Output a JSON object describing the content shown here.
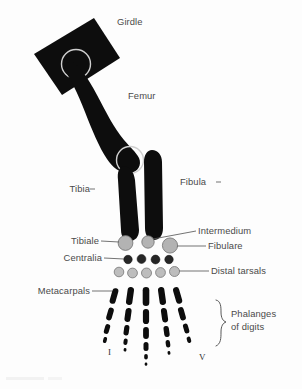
{
  "figure": {
    "background_color": "#fdfdfd",
    "bone_color": "#0d0d0d",
    "tarsal_light_color": "#b3b3b3",
    "tarsal_dark_color": "#262626",
    "joint_ring_color": "#cfcfcf",
    "label_color": "#4a4a4a"
  },
  "labels": {
    "girdle": "Girdle",
    "femur": "Femur",
    "tibia": "Tibia",
    "fibula": "Fibula",
    "tibiale": "Tibiale",
    "intermedium": "Intermedium",
    "centralia": "Centralia",
    "fibulare": "Fibulare",
    "distal_tarsals": "Distal tarsals",
    "metacarpals": "Metacarpals",
    "phalanges_line1": "Phalanges",
    "phalanges_line2": "of digits",
    "digit_first": "I",
    "digit_fifth": "V"
  },
  "anatomy": {
    "girdle": {
      "shape": "rotated-rectangle",
      "acetabulum": "light circle socket"
    },
    "proximal_tarsals": [
      {
        "name": "tibiale",
        "cx": 125.5,
        "cy": 243.0,
        "r": 7.4,
        "shade": "light"
      },
      {
        "name": "intermedium",
        "cx": 148.0,
        "cy": 242.0,
        "r": 6.2,
        "shade": "light"
      },
      {
        "name": "fibulare",
        "cx": 170.0,
        "cy": 245.5,
        "r": 7.6,
        "shade": "light"
      }
    ],
    "centralia": [
      {
        "cx": 128.0,
        "cy": 259.5,
        "r": 4.2
      },
      {
        "cx": 141.5,
        "cy": 259.0,
        "r": 4.4
      },
      {
        "cx": 155.5,
        "cy": 259.5,
        "r": 4.4
      },
      {
        "cx": 169.0,
        "cy": 259.5,
        "r": 4.2
      }
    ],
    "distal_tarsals": [
      {
        "cx": 119.0,
        "cy": 272.0,
        "r": 4.8
      },
      {
        "cx": 132.5,
        "cy": 273.0,
        "r": 4.9
      },
      {
        "cx": 146.5,
        "cy": 273.0,
        "r": 5.0
      },
      {
        "cx": 160.5,
        "cy": 272.5,
        "r": 4.9
      },
      {
        "cx": 174.5,
        "cy": 271.5,
        "r": 5.0
      }
    ],
    "digits": [
      {
        "numeral": "I",
        "elements": [
          {
            "x": 114.0,
            "y": 288.0,
            "w": 6.0,
            "h": 16.0,
            "rot": 16
          },
          {
            "x": 110.0,
            "y": 307.5,
            "w": 5.6,
            "h": 13.0,
            "rot": 16
          },
          {
            "x": 107.0,
            "y": 324.0,
            "w": 5.0,
            "h": 10.0,
            "rot": 16
          },
          {
            "x": 105.0,
            "y": 337.0,
            "w": 3.6,
            "h": 6.0,
            "rot": 16
          }
        ]
      },
      {
        "numeral": "II",
        "elements": [
          {
            "x": 130.0,
            "y": 287.0,
            "w": 6.4,
            "h": 18.0,
            "rot": 8
          },
          {
            "x": 128.0,
            "y": 308.0,
            "w": 6.0,
            "h": 14.0,
            "rot": 8
          },
          {
            "x": 126.5,
            "y": 325.0,
            "w": 5.2,
            "h": 10.5,
            "rot": 8
          },
          {
            "x": 125.5,
            "y": 338.5,
            "w": 4.0,
            "h": 6.5,
            "rot": 8
          },
          {
            "x": 125.0,
            "y": 348.0,
            "w": 2.8,
            "h": 3.6,
            "rot": 8
          }
        ]
      },
      {
        "numeral": "III",
        "elements": [
          {
            "x": 146.0,
            "y": 287.0,
            "w": 6.6,
            "h": 19.0,
            "rot": 0
          },
          {
            "x": 146.0,
            "y": 309.0,
            "w": 6.2,
            "h": 15.0,
            "rot": 0
          },
          {
            "x": 146.0,
            "y": 327.0,
            "w": 5.8,
            "h": 12.0,
            "rot": 0
          },
          {
            "x": 146.0,
            "y": 342.0,
            "w": 5.0,
            "h": 9.0,
            "rot": 0
          },
          {
            "x": 146.0,
            "y": 354.0,
            "w": 3.6,
            "h": 5.5,
            "rot": 0
          },
          {
            "x": 146.0,
            "y": 362.5,
            "w": 2.6,
            "h": 3.2,
            "rot": 0
          }
        ]
      },
      {
        "numeral": "IV",
        "elements": [
          {
            "x": 162.0,
            "y": 287.0,
            "w": 6.4,
            "h": 18.0,
            "rot": -8
          },
          {
            "x": 164.5,
            "y": 308.0,
            "w": 6.0,
            "h": 14.5,
            "rot": -8
          },
          {
            "x": 166.5,
            "y": 326.0,
            "w": 5.4,
            "h": 11.0,
            "rot": -8
          },
          {
            "x": 168.0,
            "y": 340.0,
            "w": 4.4,
            "h": 7.5,
            "rot": -8
          },
          {
            "x": 169.0,
            "y": 351.0,
            "w": 2.8,
            "h": 3.8,
            "rot": -8
          }
        ]
      },
      {
        "numeral": "V",
        "elements": [
          {
            "x": 177.5,
            "y": 287.0,
            "w": 6.2,
            "h": 17.0,
            "rot": -16
          },
          {
            "x": 182.0,
            "y": 307.0,
            "w": 5.8,
            "h": 13.5,
            "rot": -16
          },
          {
            "x": 186.0,
            "y": 323.5,
            "w": 5.0,
            "h": 10.0,
            "rot": -16
          },
          {
            "x": 189.0,
            "y": 336.5,
            "w": 4.0,
            "h": 6.5,
            "rot": -16
          }
        ]
      }
    ]
  }
}
